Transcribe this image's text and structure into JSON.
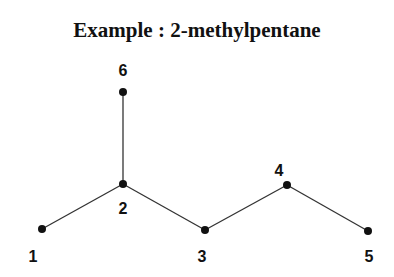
{
  "title": "Example : 2-methylpentane",
  "diagram": {
    "nodes": [
      {
        "id": "1",
        "label": "1",
        "x": 42,
        "y": 229,
        "lx": 33,
        "ly": 262
      },
      {
        "id": "2",
        "label": "2",
        "x": 123,
        "y": 184,
        "lx": 123,
        "ly": 214
      },
      {
        "id": "3",
        "label": "3",
        "x": 205,
        "y": 230,
        "lx": 202,
        "ly": 262
      },
      {
        "id": "4",
        "label": "4",
        "x": 287,
        "y": 185,
        "lx": 279,
        "ly": 176
      },
      {
        "id": "5",
        "label": "5",
        "x": 368,
        "y": 231,
        "lx": 369,
        "ly": 262
      },
      {
        "id": "6",
        "label": "6",
        "x": 123,
        "y": 92,
        "lx": 123,
        "ly": 76
      }
    ],
    "edges": [
      [
        "1",
        "2"
      ],
      [
        "2",
        "3"
      ],
      [
        "3",
        "4"
      ],
      [
        "4",
        "5"
      ],
      [
        "2",
        "6"
      ]
    ],
    "colors": {
      "line": "#333333",
      "node": "#111111"
    }
  }
}
